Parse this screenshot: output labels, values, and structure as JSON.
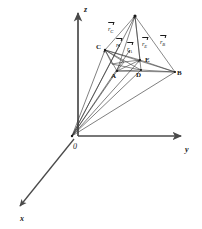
{
  "figure": {
    "kind": "3d-vector-diagram",
    "background_color": "#ffffff",
    "line_color": "#3a3a3a",
    "axis_color": "#4a4a4a",
    "text_color": "#1a1a1a"
  },
  "axes": [
    {
      "id": "z",
      "label": "z",
      "label_x": 84,
      "label_y": 6
    },
    {
      "id": "y",
      "label": "y",
      "label_x": 185,
      "label_y": 146
    },
    {
      "id": "x",
      "label": "x",
      "label_x": 20,
      "label_y": 215
    }
  ],
  "origin": {
    "label": "0",
    "label_x": 73,
    "label_y": 143,
    "point_x": 72,
    "point_y": 136
  },
  "vertices": [
    {
      "id": "P",
      "label": "",
      "x": 135,
      "y": 16,
      "label_x": 0,
      "label_y": 0,
      "dot": true
    },
    {
      "id": "C",
      "label": "C",
      "x": 105,
      "y": 50,
      "label_x": 96,
      "label_y": 44,
      "dot": true
    },
    {
      "id": "A",
      "label": "A",
      "x": 117,
      "y": 71,
      "label_x": 111,
      "label_y": 73,
      "dot": true
    },
    {
      "id": "D",
      "label": "D",
      "x": 141,
      "y": 70,
      "label_x": 136,
      "label_y": 72,
      "dot": true
    },
    {
      "id": "B",
      "label": "B",
      "x": 175,
      "y": 72,
      "label_x": 177,
      "label_y": 70,
      "dot": true
    },
    {
      "id": "E",
      "label": "E",
      "x": 140,
      "y": 60,
      "label_x": 145,
      "label_y": 57,
      "dot": false
    }
  ],
  "vector_labels": [
    {
      "id": "r_C",
      "base": "r",
      "sub": "C",
      "x": 108,
      "y": 26
    },
    {
      "id": "r",
      "base": "r",
      "sub": "",
      "x": 116,
      "y": 42
    },
    {
      "id": "r_A",
      "base": "r",
      "sub": "A",
      "x": 127,
      "y": 46
    },
    {
      "id": "r_E",
      "base": "r",
      "sub": "E",
      "x": 142,
      "y": 41
    },
    {
      "id": "r_B",
      "base": "r",
      "sub": "B",
      "x": 160,
      "y": 39
    }
  ]
}
